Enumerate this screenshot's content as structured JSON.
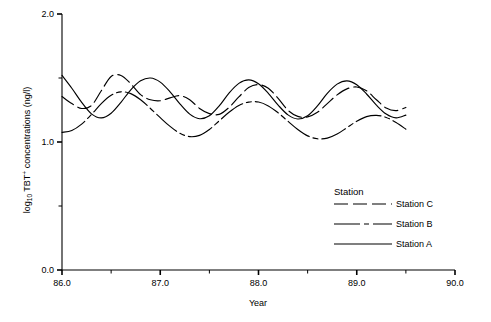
{
  "chart_data": {
    "type": "line",
    "title": "",
    "xlabel": "Year",
    "ylabel": "log10 TBT+ concentrations (ng/l)",
    "ylabel_parts": {
      "prefix": "log",
      "subscript": "10",
      "middle": " TBT",
      "superscript": "+",
      "suffix": " concentrations (ng/l)"
    },
    "xlim": [
      86.0,
      90.0
    ],
    "ylim": [
      0.0,
      2.0
    ],
    "xticks": [
      "86.0",
      "87.0",
      "88.0",
      "89.0",
      "90.0"
    ],
    "xtick_values": [
      86.0,
      87.0,
      88.0,
      89.0,
      90.0
    ],
    "xminor_values": [
      86.5,
      87.5,
      88.5,
      89.5
    ],
    "yticks": [
      "0.0",
      "1.0",
      "2.0"
    ],
    "ytick_values": [
      0.0,
      1.0,
      2.0
    ],
    "yminor_values": [
      0.5,
      1.5
    ],
    "grid": false,
    "legend_position": "inside-lower-right",
    "legend_title": "Station",
    "series": [
      {
        "name": "Station C",
        "dash": "14,5",
        "x": [
          86.0,
          86.1,
          86.2,
          86.3,
          86.4,
          86.5,
          86.6,
          86.7,
          86.8,
          86.9,
          87.0,
          87.1,
          87.2,
          87.3,
          87.4,
          87.5,
          87.6,
          87.7,
          87.8,
          87.9,
          88.0,
          88.1,
          88.2,
          88.3,
          88.4,
          88.5,
          88.6,
          88.7,
          88.8,
          88.9,
          89.0,
          89.1,
          89.2,
          89.3,
          89.4,
          89.5
        ],
        "y": [
          1.355,
          1.3,
          1.262,
          1.285,
          1.4,
          1.512,
          1.52,
          1.455,
          1.37,
          1.33,
          1.322,
          1.345,
          1.362,
          1.33,
          1.262,
          1.222,
          1.216,
          1.27,
          1.352,
          1.425,
          1.448,
          1.42,
          1.34,
          1.248,
          1.2,
          1.196,
          1.232,
          1.3,
          1.368,
          1.415,
          1.43,
          1.4,
          1.33,
          1.265,
          1.245,
          1.27
        ]
      },
      {
        "name": "Station B",
        "dash": "26,4,5,4",
        "x": [
          86.0,
          86.1,
          86.2,
          86.3,
          86.4,
          86.5,
          86.6,
          86.7,
          86.8,
          86.9,
          87.0,
          87.1,
          87.2,
          87.3,
          87.4,
          87.5,
          87.6,
          87.7,
          87.8,
          87.9,
          88.0,
          88.1,
          88.2,
          88.3,
          88.4,
          88.5,
          88.6,
          88.7,
          88.8,
          88.9,
          89.0,
          89.1,
          89.2,
          89.3,
          89.4,
          89.5
        ],
        "y": [
          1.075,
          1.09,
          1.14,
          1.215,
          1.3,
          1.365,
          1.392,
          1.378,
          1.33,
          1.262,
          1.19,
          1.122,
          1.068,
          1.042,
          1.052,
          1.098,
          1.165,
          1.232,
          1.285,
          1.312,
          1.312,
          1.282,
          1.228,
          1.162,
          1.098,
          1.048,
          1.025,
          1.03,
          1.062,
          1.112,
          1.162,
          1.198,
          1.208,
          1.192,
          1.152,
          1.1
        ]
      },
      {
        "name": "Station A",
        "dash": "none",
        "x": [
          86.0,
          86.1,
          86.2,
          86.3,
          86.4,
          86.5,
          86.6,
          86.7,
          86.8,
          86.9,
          87.0,
          87.1,
          87.2,
          87.3,
          87.4,
          87.5,
          87.6,
          87.7,
          87.8,
          87.9,
          88.0,
          88.1,
          88.2,
          88.3,
          88.4,
          88.5,
          88.6,
          88.7,
          88.8,
          88.9,
          89.0,
          89.1,
          89.2,
          89.3,
          89.4,
          89.5
        ],
        "y": [
          1.52,
          1.42,
          1.31,
          1.22,
          1.188,
          1.225,
          1.31,
          1.408,
          1.478,
          1.5,
          1.468,
          1.392,
          1.298,
          1.218,
          1.182,
          1.205,
          1.282,
          1.382,
          1.458,
          1.485,
          1.455,
          1.38,
          1.288,
          1.212,
          1.18,
          1.205,
          1.282,
          1.38,
          1.452,
          1.478,
          1.448,
          1.375,
          1.288,
          1.218,
          1.188,
          1.21
        ]
      }
    ],
    "series_note": "Station A is drawn with y mapped below; see geometry.",
    "geometry": {
      "plot_left_px": 62,
      "plot_right_px": 455,
      "plot_top_px": 14,
      "plot_bottom_px": 270,
      "data_end_year": 89.5
    }
  },
  "legend": {
    "title": "Station",
    "entries": [
      {
        "label": "Station C"
      },
      {
        "label": "Station B"
      },
      {
        "label": "Station A"
      }
    ]
  },
  "axes": {
    "x_title": "Year",
    "y_title_prefix": "log",
    "y_title_sub": "10",
    "y_title_mid": " TBT",
    "y_title_sup": "+",
    "y_title_rest": " concentrations (ng/l)"
  }
}
